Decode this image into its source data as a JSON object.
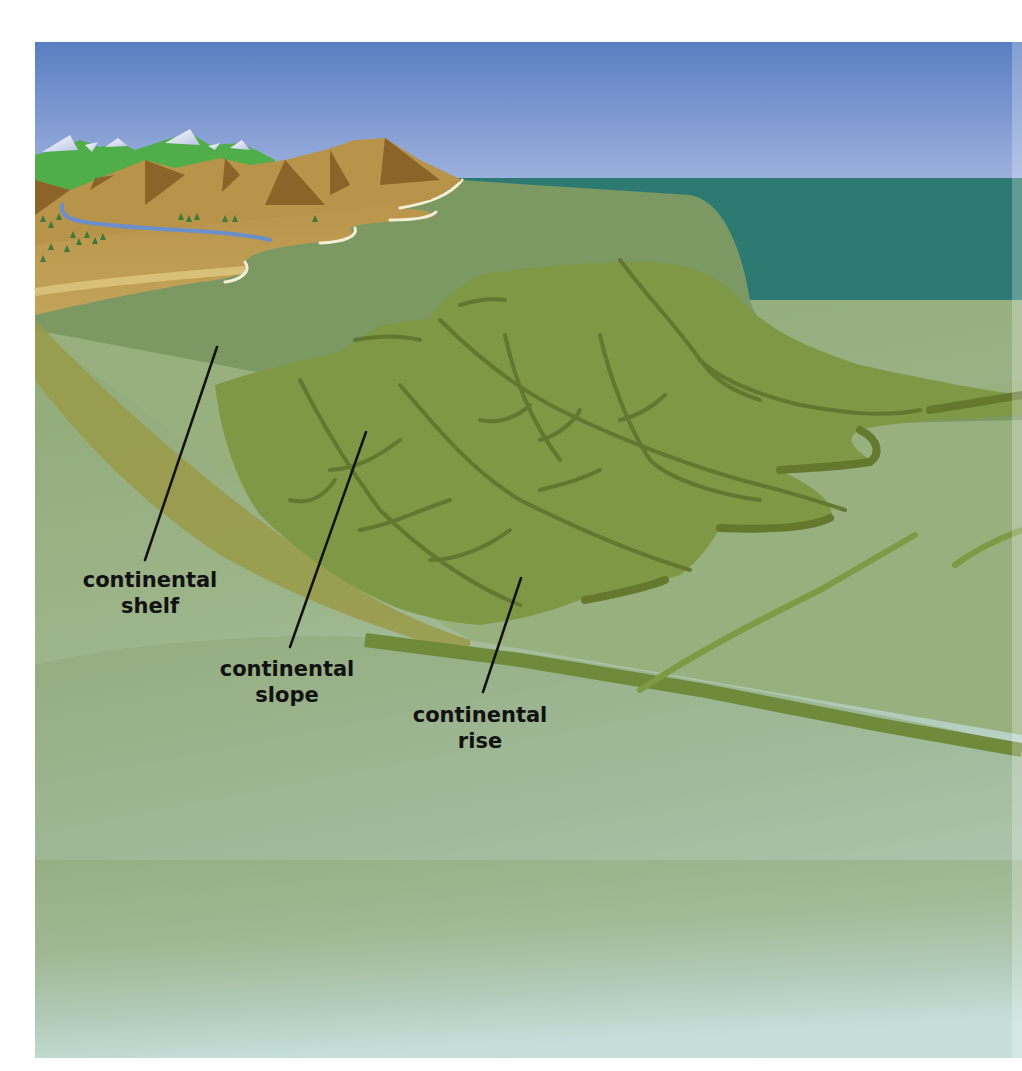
{
  "figure": {
    "colors": {
      "sky_top": "#5a7ec2",
      "sky_bottom": "#9aaedb",
      "ocean": "#2d7a72",
      "shelf": "#7a9660",
      "slope": "#7a9440",
      "slope_dark": "#62782e",
      "rise": "#8fa870",
      "abyssal_top": "#90aa78",
      "abyssal_bottom": "#d2ecf4",
      "land": "#b8954a",
      "land_dark": "#8a6428",
      "mountain_green": "#4fae4a",
      "snow": "#eef2fa",
      "river": "#6a8fcc",
      "beach": "#f4f0d8",
      "leader_line": "#111111"
    }
  },
  "labels": [
    {
      "id": "shelf",
      "line1": "continental",
      "line2": "shelf"
    },
    {
      "id": "slope",
      "line1": "continental",
      "line2": "slope"
    },
    {
      "id": "rise",
      "line1": "continental",
      "line2": "rise"
    }
  ]
}
